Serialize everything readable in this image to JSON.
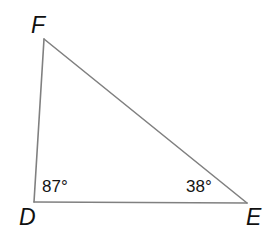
{
  "figure": {
    "kind": "geometry-diagram",
    "shape": "triangle",
    "name": "Triangle DEF",
    "background_color": "#ffffff",
    "stroke_color": "#808080",
    "stroke_width": 1.6,
    "text_color": "#141414"
  },
  "vertices": {
    "F": {
      "label": "F",
      "x": 44,
      "y": 39
    },
    "D": {
      "label": "D",
      "x": 34,
      "y": 202
    },
    "E": {
      "label": "E",
      "x": 247,
      "y": 203
    }
  },
  "vertex_labels": {
    "f": "F",
    "d": "D",
    "e": "E"
  },
  "angles": {
    "at_D": {
      "label": "87°",
      "value": 87,
      "unit": "degrees"
    },
    "at_E": {
      "label": "38°",
      "value": 38,
      "unit": "degrees"
    },
    "at_F": {
      "label": "",
      "value": 55,
      "unit": "degrees"
    }
  },
  "sides": [
    {
      "name": "DF",
      "from": "D",
      "to": "F"
    },
    {
      "name": "FE",
      "from": "F",
      "to": "E"
    },
    {
      "name": "DE",
      "from": "D",
      "to": "E"
    }
  ]
}
